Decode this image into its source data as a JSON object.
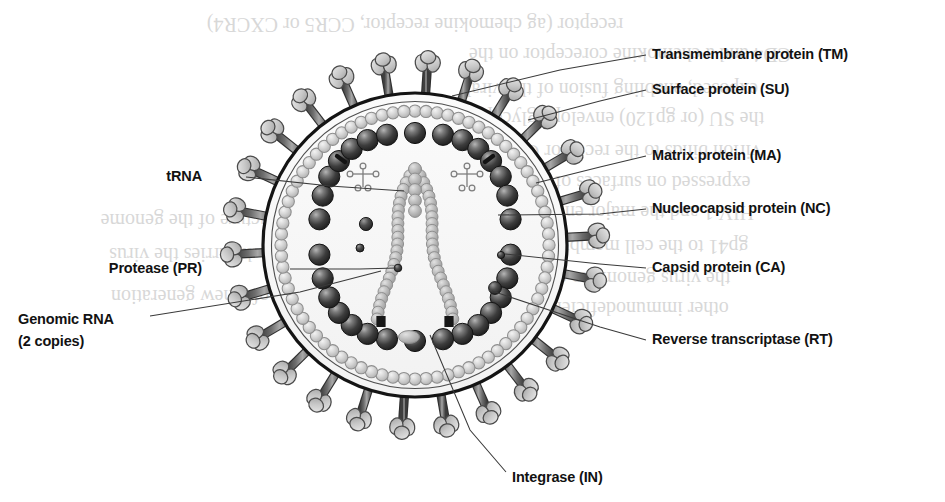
{
  "figure": {
    "kind": "scientific-illustration",
    "canvas": {
      "width": 945,
      "height": 502,
      "background": "#ffffff"
    },
    "virion": {
      "center_x": 415,
      "center_y": 245,
      "envelope_outer_radius": 152,
      "envelope_inner_radius": 143,
      "matrix_ring_radius": 134,
      "spike_tip_radius": 196,
      "spike_count": 26,
      "capsid_bead_count": 30,
      "capsid_radius_x": 96,
      "capsid_radius_y": 104
    },
    "colors": {
      "outline": "#1b1b1b",
      "envelope_line": "#141414",
      "spike_stalk_dark": "#5a5a5a",
      "spike_stalk_light": "#9d9d9d",
      "spike_head_fill": "#c9c9c9",
      "spike_head_edge": "#4a4a4a",
      "matrix_bead_fill": "#d3d3d3",
      "matrix_bead_edge": "#8e8e8e",
      "capsid_bead_dark": "#2e2e2e",
      "capsid_bead_mid": "#555555",
      "capsid_bead_hilite": "#aeaeae",
      "rna_bead": "#b6b6b6",
      "rna_bead_edge": "#8a8a8a",
      "enzyme_dot": "#3b3b3b",
      "leader_line": "#3a3a3a",
      "label_text": "#121212",
      "ghost_text": "#b9b9b9"
    }
  },
  "labels": {
    "right": [
      {
        "id": "tm",
        "text": "Transmembrane protein (TM)",
        "x": 652,
        "y": 59
      },
      {
        "id": "su",
        "text": "Surface protein (SU)",
        "x": 652,
        "y": 94
      },
      {
        "id": "ma",
        "text": "Matrix protein (MA)",
        "x": 652,
        "y": 160
      },
      {
        "id": "nc",
        "text": "Nucleocapsid protein (NC)",
        "x": 652,
        "y": 213
      },
      {
        "id": "ca",
        "text": "Capsid protein (CA)",
        "x": 652,
        "y": 272
      },
      {
        "id": "rt",
        "text": "Reverse transcriptase (RT)",
        "x": 652,
        "y": 344
      }
    ],
    "left": [
      {
        "id": "trna",
        "text": "tRNA",
        "x": 202,
        "y": 181
      },
      {
        "id": "pr",
        "text": "Protease (PR)",
        "x": 202,
        "y": 273
      }
    ],
    "left_multiline": [
      {
        "id": "rna",
        "line1": "Genomic RNA",
        "line2": "(2 copies)",
        "x": 18,
        "y": 324,
        "line_gap": 22
      }
    ],
    "bottom": [
      {
        "id": "in",
        "text": "Integrase (IN)",
        "x": 512,
        "y": 482
      }
    ]
  },
  "leader_lines": [
    {
      "id": "leader-tm",
      "label": "tm",
      "points": "646,55 560,70 452,96"
    },
    {
      "id": "leader-su",
      "label": "su",
      "points": "646,90 600,101 528,120"
    },
    {
      "id": "leader-ma",
      "label": "ma",
      "points": "646,156 600,167 536,183"
    },
    {
      "id": "leader-nc",
      "label": "nc",
      "points": "646,209 600,214 498,215"
    },
    {
      "id": "leader-ca",
      "label": "ca",
      "points": "646,268 600,264 505,254"
    },
    {
      "id": "leader-rt",
      "label": "rt",
      "points": "646,340 600,327 492,291"
    },
    {
      "id": "leader-trna",
      "label": "trna",
      "points": "246,177 330,186 404,191"
    },
    {
      "id": "leader-pr",
      "label": "pr",
      "points": "290,269 360,269 396,268"
    },
    {
      "id": "leader-rna",
      "label": "rna",
      "points": "150,316 300,292 381,271"
    },
    {
      "id": "leader-in",
      "label": "in",
      "points": "506,472 470,430 430,335"
    }
  ],
  "ghost_text": {
    "note": "faint show-through text from reverse of scanned page",
    "lines": [
      {
        "text": "receptor (ag chemokine receptor, CCR5 or CXCR4)",
        "x": 415,
        "y": 18
      },
      {
        "text": "CD4 and a chemokine coreceptor on the",
        "x": 630,
        "y": 48
      },
      {
        "text": "exposed, enabling fusion of the viral",
        "x": 612,
        "y": 83
      },
      {
        "text": "the SU (or gp120) envelope glycoprotein",
        "x": 600,
        "y": 112
      },
      {
        "text": "virion binds to the receptor CD4 on the",
        "x": 604,
        "y": 145
      },
      {
        "text": "expressed on surfaces of helper T cells",
        "x": 596,
        "y": 176
      },
      {
        "text": "HIV-1 and the major envelope protein",
        "x": 602,
        "y": 206
      },
      {
        "text": "gp41 to the cell membrane (SU)",
        "x": 620,
        "y": 240
      },
      {
        "text": "the virus genome to enter the",
        "x": 614,
        "y": 272
      },
      {
        "text": "other immunodeficiency viruses",
        "x": 600,
        "y": 302
      },
      {
        "text": "the structure of the genome",
        "x": 210,
        "y": 214
      },
      {
        "text": "which carries the virus",
        "x": 200,
        "y": 248
      },
      {
        "text": "of a new generation",
        "x": 190,
        "y": 290
      }
    ]
  }
}
